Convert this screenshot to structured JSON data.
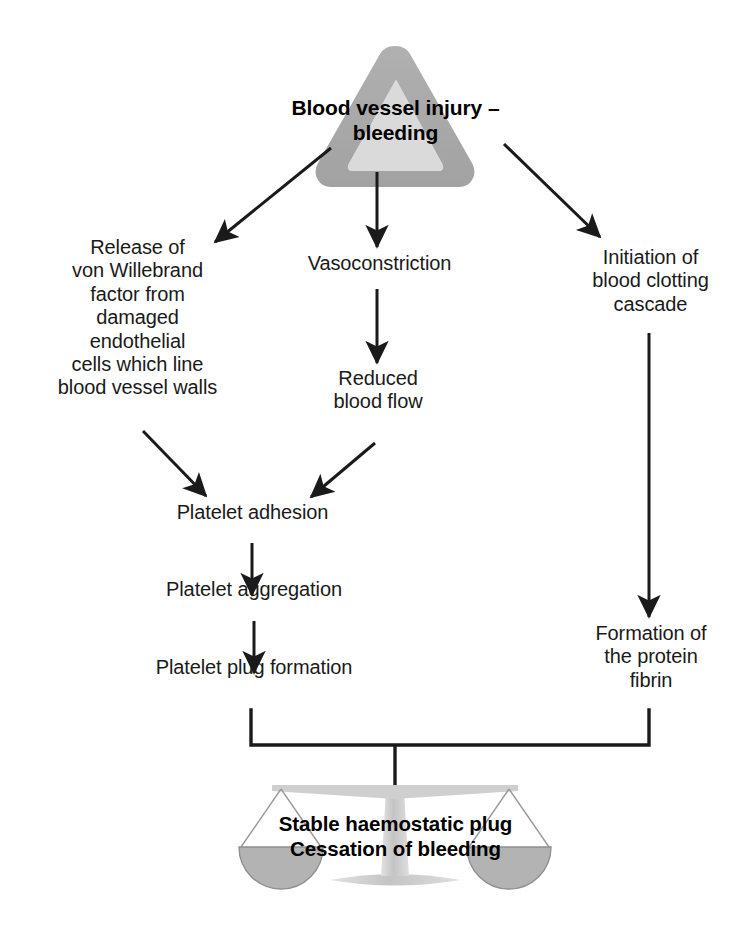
{
  "diagram": {
    "type": "flowchart",
    "background_color": "#ffffff",
    "text_color": "#1a1a1a",
    "arrow_color": "#1a1a1a",
    "triangle_outer_color": "#a8a8a8",
    "triangle_inner_color": "#d9d9d9",
    "scales_pan_fill": "#b3b3b3",
    "scales_stand_color": "#cccccc"
  },
  "nodes": {
    "injury": {
      "label": "Blood vessel injury –\nbleeding",
      "icon": "warning-triangle-icon"
    },
    "vwf": {
      "label": "Release of\nvon Willebrand\nfactor from\ndamaged\nendothelial\ncells which line\nblood vessel walls"
    },
    "vasoconstriction": {
      "label": "Vasoconstriction"
    },
    "clotting_cascade": {
      "label": "Initiation of\nblood clotting\ncascade"
    },
    "reduced_flow": {
      "label": "Reduced\nblood flow"
    },
    "platelet_adhesion": {
      "label": "Platelet adhesion"
    },
    "platelet_aggregation": {
      "label": "Platelet aggregation"
    },
    "platelet_plug": {
      "label": "Platelet plug formation"
    },
    "fibrin": {
      "label": "Formation of\nthe protein\nfibrin"
    },
    "outcome": {
      "line1": "Stable haemostatic plug",
      "line2": "Cessation of bleeding",
      "icon": "balance-scales-icon"
    }
  },
  "edges": [
    {
      "from": "injury",
      "to": "vwf",
      "style": "arrow-diagonal-left"
    },
    {
      "from": "injury",
      "to": "vasoconstriction",
      "style": "arrow-vertical"
    },
    {
      "from": "injury",
      "to": "clotting_cascade",
      "style": "arrow-diagonal-right"
    },
    {
      "from": "vasoconstriction",
      "to": "reduced_flow",
      "style": "arrow-vertical"
    },
    {
      "from": "vwf",
      "to": "platelet_adhesion",
      "style": "arrow-diagonal-right"
    },
    {
      "from": "reduced_flow",
      "to": "platelet_adhesion",
      "style": "arrow-diagonal-left"
    },
    {
      "from": "platelet_adhesion",
      "to": "platelet_aggregation",
      "style": "arrow-vertical"
    },
    {
      "from": "platelet_aggregation",
      "to": "platelet_plug",
      "style": "arrow-vertical"
    },
    {
      "from": "clotting_cascade",
      "to": "fibrin",
      "style": "arrow-vertical"
    },
    {
      "from": "platelet_plug",
      "to": "outcome",
      "style": "bracket-merge"
    },
    {
      "from": "fibrin",
      "to": "outcome",
      "style": "bracket-merge"
    }
  ]
}
